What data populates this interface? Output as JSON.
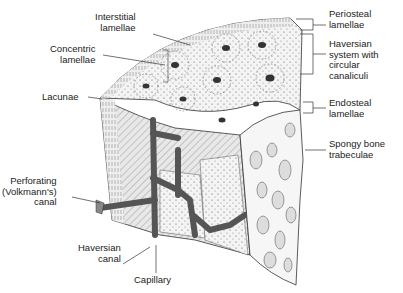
{
  "labels": {
    "interstitial": "Interstitial\nlamellae",
    "concentric": "Concentric\nlamellae",
    "lacunae": "Lacunae",
    "perforating": "Perforating\n(Volkmann's)\ncanal",
    "haversian_canal": "Haversian\ncanal",
    "capillary": "Capillary",
    "periosteal": "Periosteal\nlamellae",
    "haversian_system": "Haversian\nsystem with\ncircular\ncanaliculi",
    "endosteal": "Endosteal\nlamellae",
    "spongy": "Spongy bone\ntrabeculae"
  },
  "colors": {
    "ink": "#222222",
    "bone_fill": "#f2f2f2",
    "canal": "#6b6b6b",
    "background": "#ffffff"
  }
}
